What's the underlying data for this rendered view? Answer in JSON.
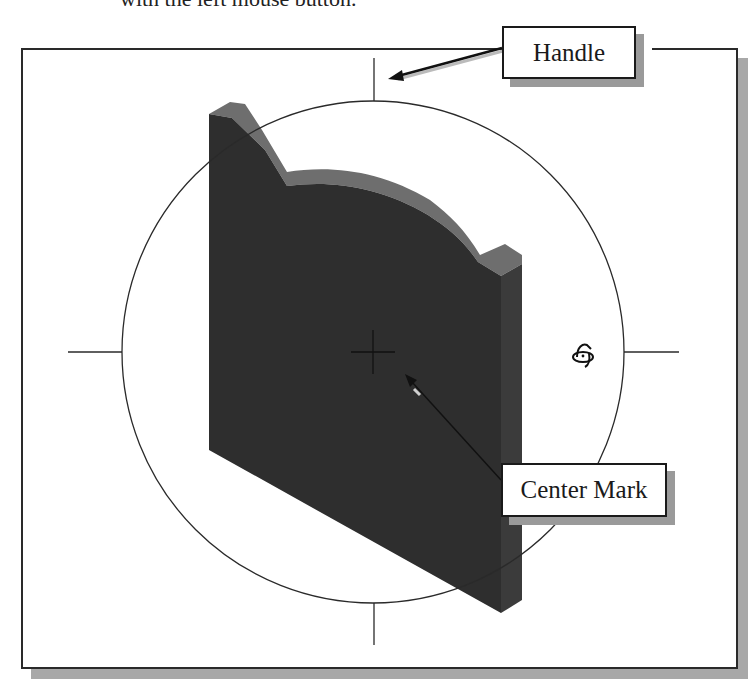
{
  "caption": {
    "partial_text": "with the left mouse button."
  },
  "diagram": {
    "frame": {
      "x": 21,
      "y": 48,
      "width": 717,
      "height": 621
    },
    "circle": {
      "cx": 373,
      "cy": 352,
      "r": 251
    },
    "handles": [
      {
        "name": "top",
        "x1": 374,
        "y1": 58,
        "x2": 374,
        "y2": 101
      },
      {
        "name": "bottom",
        "x1": 374,
        "y1": 603,
        "x2": 374,
        "y2": 645
      },
      {
        "name": "left",
        "x1": 68,
        "y1": 352,
        "x2": 122,
        "y2": 352
      },
      {
        "name": "right",
        "x1": 624,
        "y1": 352,
        "x2": 679,
        "y2": 352
      }
    ],
    "center_mark": {
      "x": 373,
      "y": 352,
      "size": 22
    },
    "rotate_cursor_icon": {
      "name": "rotate-cursor-icon",
      "x": 580,
      "y": 355
    },
    "part": {
      "front_color": "#2e2e2e",
      "top_color": "#6a6a6a",
      "side_color": "#3a3a3a"
    }
  },
  "callouts": {
    "handle": {
      "label": "Handle",
      "arrow_from": [
        502,
        48
      ],
      "arrow_to": [
        390,
        77
      ]
    },
    "center_mark": {
      "label": "Center Mark",
      "arrow_from": [
        501,
        480
      ],
      "arrow_to": [
        406,
        375
      ]
    }
  },
  "colors": {
    "line": "#2a2a2a",
    "shadow": "#a8a8a8",
    "background": "#ffffff"
  }
}
